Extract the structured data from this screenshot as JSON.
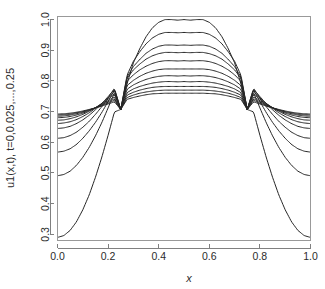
{
  "chart_data": {
    "type": "line",
    "title": "",
    "subtitle": "",
    "xlabel": "x",
    "ylabel": "u1(x,t), t=0,0.025,...,0.25",
    "xlim": [
      0.0,
      1.0
    ],
    "ylim": [
      0.28,
      1.01
    ],
    "grid": false,
    "legend": "none",
    "xticks": [
      "0.0",
      "0.2",
      "0.4",
      "0.6",
      "0.8",
      "1.0"
    ],
    "xtick_values": [
      0.0,
      0.2,
      0.4,
      0.6,
      0.8,
      1.0
    ],
    "yticks": [
      "0.3",
      "0.4",
      "0.5",
      "0.6",
      "0.7",
      "0.8",
      "0.9",
      "1.0"
    ],
    "ytick_values": [
      0.3,
      0.4,
      0.5,
      0.6,
      0.7,
      0.8,
      0.9,
      1.0
    ],
    "x": [
      0.0,
      0.025,
      0.05,
      0.075,
      0.1,
      0.125,
      0.15,
      0.175,
      0.2,
      0.225,
      0.25,
      0.275,
      0.3,
      0.325,
      0.35,
      0.375,
      0.4,
      0.425,
      0.45,
      0.475,
      0.5,
      0.525,
      0.55,
      0.575,
      0.6,
      0.625,
      0.65,
      0.675,
      0.7,
      0.725,
      0.75,
      0.775,
      0.8,
      0.825,
      0.85,
      0.875,
      0.9,
      0.925,
      0.95,
      0.975,
      1.0
    ],
    "node_points": [
      0.25,
      0.75
    ],
    "node_value": 0.707,
    "series": [
      {
        "name": "t=0",
        "t": 0.0,
        "values": [
          0.29,
          0.296,
          0.313,
          0.341,
          0.38,
          0.428,
          0.486,
          0.551,
          0.623,
          0.699,
          0.707,
          0.791,
          0.859,
          0.905,
          0.944,
          0.973,
          0.991,
          1.0,
          1.0,
          0.998,
          1.0,
          0.998,
          1.0,
          1.0,
          0.991,
          0.973,
          0.944,
          0.905,
          0.859,
          0.791,
          0.707,
          0.699,
          0.623,
          0.551,
          0.486,
          0.428,
          0.38,
          0.341,
          0.313,
          0.296,
          0.29
        ]
      },
      {
        "name": "t=0.025",
        "t": 0.025,
        "values": [
          0.491,
          0.495,
          0.506,
          0.525,
          0.551,
          0.583,
          0.621,
          0.664,
          0.712,
          0.762,
          0.707,
          0.819,
          0.864,
          0.895,
          0.921,
          0.94,
          0.952,
          0.958,
          0.958,
          0.957,
          0.958,
          0.957,
          0.958,
          0.958,
          0.952,
          0.94,
          0.921,
          0.895,
          0.864,
          0.819,
          0.707,
          0.762,
          0.712,
          0.664,
          0.621,
          0.583,
          0.551,
          0.525,
          0.506,
          0.495,
          0.491
        ]
      },
      {
        "name": "t=0.05",
        "t": 0.05,
        "values": [
          0.568,
          0.571,
          0.579,
          0.593,
          0.613,
          0.637,
          0.665,
          0.697,
          0.733,
          0.771,
          0.707,
          0.813,
          0.847,
          0.87,
          0.89,
          0.904,
          0.913,
          0.917,
          0.917,
          0.916,
          0.917,
          0.916,
          0.917,
          0.917,
          0.913,
          0.904,
          0.89,
          0.87,
          0.847,
          0.813,
          0.707,
          0.771,
          0.733,
          0.697,
          0.665,
          0.637,
          0.613,
          0.593,
          0.579,
          0.571,
          0.568
        ]
      },
      {
        "name": "t=0.075",
        "t": 0.075,
        "values": [
          0.613,
          0.615,
          0.622,
          0.633,
          0.649,
          0.668,
          0.691,
          0.716,
          0.745,
          0.776,
          0.707,
          0.809,
          0.836,
          0.855,
          0.871,
          0.882,
          0.889,
          0.893,
          0.893,
          0.892,
          0.893,
          0.892,
          0.893,
          0.893,
          0.889,
          0.882,
          0.871,
          0.855,
          0.836,
          0.809,
          0.707,
          0.776,
          0.745,
          0.716,
          0.691,
          0.668,
          0.649,
          0.633,
          0.622,
          0.615,
          0.613
        ]
      },
      {
        "name": "t=0.1",
        "t": 0.1,
        "values": [
          0.645,
          0.647,
          0.652,
          0.661,
          0.673,
          0.688,
          0.706,
          0.726,
          0.749,
          0.773,
          0.707,
          0.799,
          0.82,
          0.836,
          0.848,
          0.857,
          0.863,
          0.866,
          0.866,
          0.865,
          0.866,
          0.865,
          0.866,
          0.866,
          0.863,
          0.857,
          0.848,
          0.836,
          0.82,
          0.799,
          0.707,
          0.773,
          0.749,
          0.726,
          0.706,
          0.688,
          0.673,
          0.661,
          0.652,
          0.647,
          0.645
        ]
      },
      {
        "name": "t=0.125",
        "t": 0.125,
        "values": [
          0.661,
          0.663,
          0.667,
          0.674,
          0.684,
          0.696,
          0.711,
          0.727,
          0.745,
          0.764,
          0.707,
          0.785,
          0.802,
          0.815,
          0.825,
          0.832,
          0.837,
          0.839,
          0.839,
          0.839,
          0.839,
          0.839,
          0.839,
          0.839,
          0.837,
          0.832,
          0.825,
          0.815,
          0.802,
          0.785,
          0.707,
          0.764,
          0.745,
          0.727,
          0.711,
          0.696,
          0.684,
          0.674,
          0.667,
          0.663,
          0.661
        ]
      },
      {
        "name": "t=0.15",
        "t": 0.15,
        "values": [
          0.672,
          0.673,
          0.677,
          0.683,
          0.691,
          0.701,
          0.713,
          0.726,
          0.741,
          0.756,
          0.707,
          0.773,
          0.787,
          0.797,
          0.805,
          0.811,
          0.815,
          0.817,
          0.817,
          0.816,
          0.817,
          0.816,
          0.817,
          0.817,
          0.815,
          0.811,
          0.805,
          0.797,
          0.787,
          0.773,
          0.707,
          0.756,
          0.741,
          0.726,
          0.713,
          0.701,
          0.691,
          0.683,
          0.677,
          0.673,
          0.672
        ]
      },
      {
        "name": "t=0.175",
        "t": 0.175,
        "values": [
          0.68,
          0.681,
          0.684,
          0.689,
          0.695,
          0.703,
          0.713,
          0.724,
          0.736,
          0.748,
          0.707,
          0.762,
          0.774,
          0.782,
          0.788,
          0.793,
          0.796,
          0.798,
          0.798,
          0.797,
          0.798,
          0.797,
          0.798,
          0.798,
          0.796,
          0.793,
          0.788,
          0.782,
          0.774,
          0.762,
          0.707,
          0.748,
          0.736,
          0.724,
          0.713,
          0.703,
          0.695,
          0.689,
          0.684,
          0.681,
          0.68
        ]
      },
      {
        "name": "t=0.2",
        "t": 0.2,
        "values": [
          0.685,
          0.686,
          0.689,
          0.693,
          0.698,
          0.705,
          0.713,
          0.722,
          0.732,
          0.742,
          0.707,
          0.754,
          0.763,
          0.77,
          0.775,
          0.779,
          0.781,
          0.782,
          0.782,
          0.782,
          0.782,
          0.782,
          0.782,
          0.782,
          0.781,
          0.779,
          0.775,
          0.77,
          0.763,
          0.754,
          0.707,
          0.742,
          0.732,
          0.722,
          0.713,
          0.705,
          0.698,
          0.693,
          0.689,
          0.686,
          0.685
        ]
      },
      {
        "name": "t=0.225",
        "t": 0.225,
        "values": [
          0.689,
          0.69,
          0.692,
          0.696,
          0.7,
          0.706,
          0.712,
          0.72,
          0.728,
          0.737,
          0.707,
          0.746,
          0.754,
          0.76,
          0.764,
          0.767,
          0.769,
          0.77,
          0.77,
          0.77,
          0.77,
          0.77,
          0.77,
          0.77,
          0.769,
          0.767,
          0.764,
          0.76,
          0.754,
          0.746,
          0.707,
          0.737,
          0.728,
          0.72,
          0.712,
          0.706,
          0.7,
          0.696,
          0.692,
          0.69,
          0.689
        ]
      },
      {
        "name": "t=0.25",
        "t": 0.25,
        "values": [
          0.692,
          0.693,
          0.695,
          0.698,
          0.702,
          0.707,
          0.712,
          0.718,
          0.725,
          0.732,
          0.707,
          0.74,
          0.746,
          0.751,
          0.755,
          0.758,
          0.759,
          0.76,
          0.76,
          0.76,
          0.76,
          0.76,
          0.76,
          0.76,
          0.759,
          0.758,
          0.755,
          0.751,
          0.746,
          0.74,
          0.707,
          0.732,
          0.725,
          0.718,
          0.712,
          0.707,
          0.702,
          0.698,
          0.695,
          0.693,
          0.692
        ]
      }
    ],
    "colors": {
      "curve": "#262626",
      "axis": "#808080",
      "text": "#2b2b2b",
      "background": "#ffffff"
    }
  }
}
